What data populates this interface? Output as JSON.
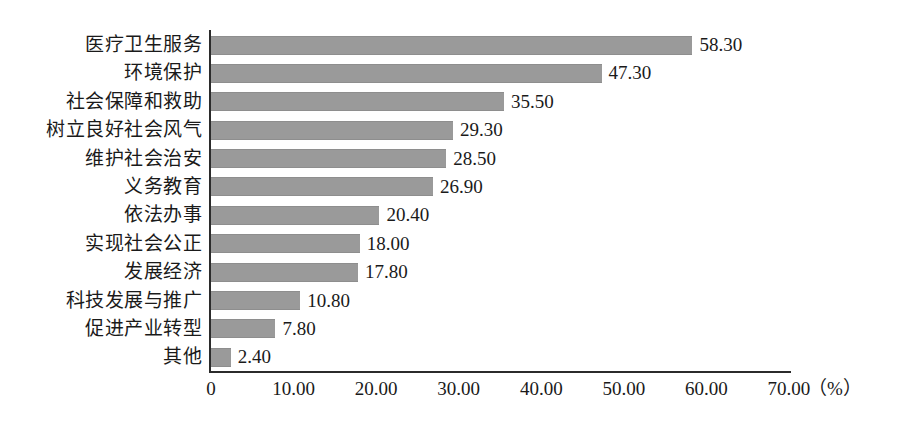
{
  "chart_data": {
    "type": "bar",
    "orientation": "horizontal",
    "title": "",
    "subtitle": "",
    "xlabel": "（%）",
    "ylabel": "",
    "categories": [
      "医疗卫生服务",
      "环境保护",
      "社会保障和救助",
      "树立良好社会风气",
      "维护社会治安",
      "义务教育",
      "依法办事",
      "实现社会公正",
      "发展经济",
      "科技发展与推广",
      "促进产业转型",
      "其他"
    ],
    "values": [
      58.3,
      47.3,
      35.5,
      29.3,
      28.5,
      26.9,
      20.4,
      18.0,
      17.8,
      10.8,
      7.8,
      2.4
    ],
    "value_labels": [
      "58.30",
      "47.30",
      "35.50",
      "29.30",
      "28.50",
      "26.90",
      "20.40",
      "18.00",
      "17.80",
      "10.80",
      "7.80",
      "2.40"
    ],
    "xlim": [
      0,
      70
    ],
    "xticks": [
      0,
      10,
      20,
      30,
      40,
      50,
      60,
      70
    ],
    "xtick_labels": [
      "0",
      "10.00",
      "20.00",
      "30.00",
      "40.00",
      "50.00",
      "60.00",
      "70.00"
    ],
    "grid": false,
    "legend": null,
    "legend_position": "none",
    "bar_color": "#9a9a9a",
    "axis_color": "#2b2b2b",
    "background_color": "#ffffff"
  }
}
